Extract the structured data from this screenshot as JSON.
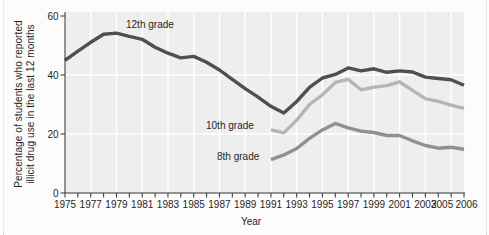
{
  "figure": {
    "y_axis_title_line1": "Percentage of students who reported",
    "y_axis_title_line2": "illicit drug use in the last 12 months",
    "x_axis_title": "Year"
  },
  "colors": {
    "page_bg": "#fcfcfc",
    "plot_bg": "#eeeeee",
    "gridline": "#ffffff",
    "axis": "#333333",
    "text": "#262626",
    "grade12_line": "#4f4f4f",
    "grade10_line": "#b5b5b5",
    "grade8_line": "#909090"
  },
  "chart_data": {
    "type": "line",
    "title": "",
    "xlabel": "Year",
    "ylabel": "Percentage of students who reported illicit drug use in the last 12 months",
    "xlim": [
      1975,
      2006
    ],
    "ylim": [
      0,
      60
    ],
    "y_ticks": [
      0,
      20,
      40,
      60
    ],
    "x_tick_labels": [
      1975,
      1977,
      1979,
      1981,
      1983,
      1985,
      1987,
      1989,
      1991,
      1993,
      1995,
      1997,
      1999,
      2001,
      2003,
      2005,
      2006
    ],
    "x_minor_tick_step": 1,
    "grid": "white gridlines on light-gray plot area; vertical every 2 years, horizontal at 20 and 40",
    "legend": "inline labels next to lines",
    "series": [
      {
        "name": "12th grade",
        "color": "#4f4f4f",
        "x_start": 1975,
        "values": [
          45.0,
          48.1,
          51.1,
          53.8,
          54.2,
          53.1,
          52.1,
          49.4,
          47.4,
          45.8,
          46.3,
          44.3,
          41.7,
          38.5,
          35.4,
          32.5,
          29.4,
          27.1,
          31.0,
          35.8,
          39.0,
          40.2,
          42.4,
          41.4,
          42.1,
          40.9,
          41.4,
          41.0,
          39.3,
          38.8,
          38.4,
          36.5
        ]
      },
      {
        "name": "10th grade",
        "color": "#b5b5b5",
        "x_start": 1991,
        "values": [
          21.4,
          20.4,
          24.7,
          30.0,
          33.3,
          37.5,
          38.5,
          35.0,
          35.9,
          36.4,
          37.7,
          34.8,
          32.0,
          31.1,
          29.8,
          28.7
        ]
      },
      {
        "name": "8th grade",
        "color": "#909090",
        "x_start": 1991,
        "values": [
          11.3,
          12.9,
          15.1,
          18.5,
          21.4,
          23.6,
          22.1,
          21.0,
          20.5,
          19.5,
          19.5,
          17.7,
          16.1,
          15.2,
          15.5,
          14.8
        ]
      }
    ]
  }
}
